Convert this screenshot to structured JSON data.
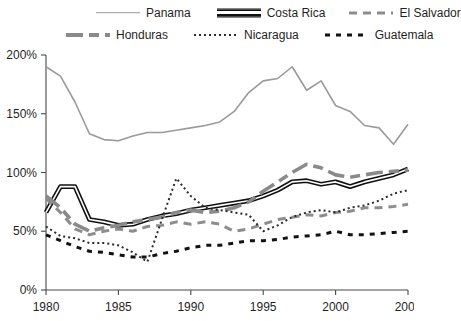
{
  "legend": {
    "rows": [
      [
        {
          "key": "panama",
          "label": "Panama",
          "style": "sw-panama"
        },
        {
          "key": "costa_rica",
          "label": "Costa Rica",
          "style": "sw-costarica"
        },
        {
          "key": "el_salvador",
          "label": "El Salvador",
          "style": "sw-elsalvador"
        }
      ],
      [
        {
          "key": "honduras",
          "label": "Honduras",
          "style": "sw-honduras"
        },
        {
          "key": "nicaragua",
          "label": "Nicaragua",
          "style": "sw-nicaragua"
        },
        {
          "key": "guatemala",
          "label": "Guatemala",
          "style": "sw-guatemala"
        }
      ]
    ]
  },
  "chart_data": {
    "type": "line",
    "title": "",
    "xlabel": "",
    "ylabel": "",
    "xlim": [
      1980,
      2005
    ],
    "ylim": [
      0,
      200
    ],
    "grid": false,
    "legend_position": "top",
    "x_ticks": [
      1980,
      1985,
      1990,
      1995,
      2000,
      2005
    ],
    "x_tick_labels": [
      "1980",
      "1985",
      "1990",
      "1995",
      "2000",
      "2005"
    ],
    "y_ticks": [
      0,
      50,
      100,
      150,
      200
    ],
    "y_tick_labels": [
      "0%",
      "50%",
      "100%",
      "150%",
      "200%"
    ],
    "x": [
      1980,
      1981,
      1982,
      1983,
      1984,
      1985,
      1986,
      1987,
      1988,
      1989,
      1990,
      1991,
      1992,
      1993,
      1994,
      1995,
      1996,
      1997,
      1998,
      1999,
      2000,
      2001,
      2002,
      2003,
      2004,
      2005
    ],
    "series": [
      {
        "name": "Panama",
        "color": "#9a9a9a",
        "dash": "none",
        "width": 1.6,
        "values": [
          190,
          182,
          160,
          133,
          128,
          127,
          131,
          134,
          134,
          136,
          138,
          140,
          143,
          152,
          168,
          178,
          180,
          190,
          170,
          178,
          157,
          152,
          140,
          138,
          124,
          141
        ]
      },
      {
        "name": "Costa Rica",
        "color": "#111111",
        "dash": "none",
        "width": 3.2,
        "double": true,
        "values": [
          66,
          88,
          88,
          60,
          58,
          55,
          56,
          60,
          63,
          65,
          68,
          70,
          72,
          74,
          76,
          80,
          85,
          92,
          93,
          90,
          92,
          88,
          92,
          95,
          98,
          103
        ]
      },
      {
        "name": "El Salvador",
        "color": "#8d8d8d",
        "dash": "8,6",
        "width": 3.0,
        "values": [
          78,
          66,
          52,
          47,
          50,
          52,
          50,
          54,
          55,
          58,
          56,
          58,
          56,
          50,
          52,
          56,
          60,
          62,
          64,
          63,
          66,
          67,
          70,
          70,
          71,
          73
        ]
      },
      {
        "name": "Honduras",
        "color": "#8a8a8a",
        "dash": "17,6,10,6",
        "width": 3.6,
        "values": [
          80,
          70,
          56,
          50,
          53,
          55,
          58,
          60,
          62,
          66,
          68,
          66,
          67,
          70,
          75,
          84,
          92,
          100,
          107,
          104,
          98,
          96,
          98,
          100,
          101,
          102
        ]
      },
      {
        "name": "Nicaragua",
        "color": "#2b2b2b",
        "dash": "2,3",
        "width": 2.0,
        "values": [
          54,
          46,
          44,
          40,
          40,
          38,
          32,
          24,
          60,
          95,
          80,
          70,
          68,
          66,
          64,
          50,
          55,
          62,
          66,
          68,
          66,
          70,
          72,
          76,
          82,
          85
        ]
      },
      {
        "name": "Guatemala",
        "color": "#121212",
        "dash": "5,6",
        "width": 3.0,
        "values": [
          47,
          42,
          37,
          33,
          32,
          30,
          28,
          28,
          31,
          33,
          36,
          38,
          38,
          40,
          42,
          42,
          43,
          45,
          46,
          47,
          50,
          47,
          47,
          48,
          49,
          50
        ]
      }
    ]
  }
}
